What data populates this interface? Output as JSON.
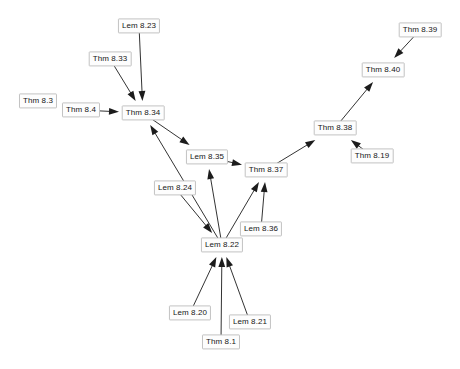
{
  "diagram": {
    "background_color": "#ffffff",
    "node_fill_color": "#fdfdfd",
    "node_border_color": "#c2c2c2",
    "node_text_color": "#161616",
    "edge_color": "#1c1c1c",
    "nodes": [
      {
        "id": "thm-8-3",
        "label": "Thm 8.3",
        "x": 38,
        "y": 101
      },
      {
        "id": "thm-8-4",
        "label": "Thm 8.4",
        "x": 81,
        "y": 110
      },
      {
        "id": "lem-8-23",
        "label": "Lem 8.23",
        "x": 139,
        "y": 26
      },
      {
        "id": "thm-8-33",
        "label": "Thm 8.33",
        "x": 110,
        "y": 59
      },
      {
        "id": "thm-8-34",
        "label": "Thm 8.34",
        "x": 143,
        "y": 113
      },
      {
        "id": "lem-8-35",
        "label": "Lem 8.35",
        "x": 207,
        "y": 157
      },
      {
        "id": "lem-8-24",
        "label": "Lem 8.24",
        "x": 175,
        "y": 188
      },
      {
        "id": "thm-8-37",
        "label": "Thm 8.37",
        "x": 266,
        "y": 170
      },
      {
        "id": "lem-8-36",
        "label": "Lem 8.36",
        "x": 261,
        "y": 229
      },
      {
        "id": "lem-8-22",
        "label": "Lem 8.22",
        "x": 222,
        "y": 245
      },
      {
        "id": "lem-8-20",
        "label": "Lem 8.20",
        "x": 190,
        "y": 313
      },
      {
        "id": "thm-8-1",
        "label": "Thm 8.1",
        "x": 221,
        "y": 342
      },
      {
        "id": "lem-8-21",
        "label": "Lem 8.21",
        "x": 250,
        "y": 322
      },
      {
        "id": "thm-8-38",
        "label": "Thm 8.38",
        "x": 335,
        "y": 128
      },
      {
        "id": "thm-8-19",
        "label": "Thm 8.19",
        "x": 372,
        "y": 156
      },
      {
        "id": "thm-8-40",
        "label": "Thm 8.40",
        "x": 383,
        "y": 70
      },
      {
        "id": "thm-8-39",
        "label": "Thm 8.39",
        "x": 420,
        "y": 30
      }
    ],
    "edges": [
      {
        "from": "thm-8-3",
        "to": "thm-8-4"
      },
      {
        "from": "thm-8-4",
        "to": "thm-8-34"
      },
      {
        "from": "lem-8-23",
        "to": "thm-8-34"
      },
      {
        "from": "thm-8-33",
        "to": "thm-8-34"
      },
      {
        "from": "lem-8-22",
        "to": "thm-8-34"
      },
      {
        "from": "thm-8-34",
        "to": "lem-8-35"
      },
      {
        "from": "lem-8-22",
        "to": "lem-8-35"
      },
      {
        "from": "lem-8-35",
        "to": "thm-8-37"
      },
      {
        "from": "lem-8-22",
        "to": "thm-8-37"
      },
      {
        "from": "lem-8-36",
        "to": "thm-8-37"
      },
      {
        "from": "lem-8-36",
        "to": "lem-8-22"
      },
      {
        "from": "lem-8-24",
        "to": "lem-8-22"
      },
      {
        "from": "lem-8-20",
        "to": "lem-8-22"
      },
      {
        "from": "thm-8-1",
        "to": "lem-8-22"
      },
      {
        "from": "lem-8-21",
        "to": "lem-8-22"
      },
      {
        "from": "thm-8-37",
        "to": "thm-8-38"
      },
      {
        "from": "thm-8-19",
        "to": "thm-8-38"
      },
      {
        "from": "thm-8-38",
        "to": "thm-8-40"
      },
      {
        "from": "thm-8-39",
        "to": "thm-8-40"
      }
    ]
  }
}
